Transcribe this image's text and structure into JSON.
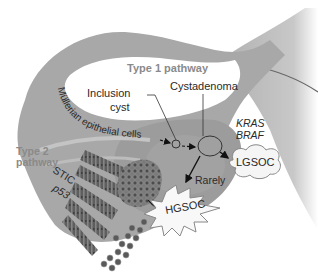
{
  "diagram": {
    "labels": {
      "type1_pathway": "Type 1 pathway",
      "type2_pathway_line1": "Type 2",
      "type2_pathway_line2": "pathway",
      "inclusion_cyst_line1": "Inclusion",
      "inclusion_cyst_line2": "cyst",
      "cystadenoma": "Cystadenoma",
      "mullerian": "Müllerian epithelial cells",
      "kras": "KRAS",
      "braf": "BRAF",
      "lgsoc": "LGSOC",
      "hgsoc": "HGSOC",
      "rarely": "Rarely",
      "stic": "STIC",
      "p53": "p53"
    },
    "colors": {
      "tissue": "#a9a9a9",
      "tissue_dark": "#8c8c8c",
      "ovary": "#9b9b9b",
      "background_tissue": "#c8c8c8",
      "lumen": "#ffffff",
      "cells": "#6e6e6e",
      "text": "#2a2a2a",
      "pathway_label": "#8a8a8a"
    }
  }
}
